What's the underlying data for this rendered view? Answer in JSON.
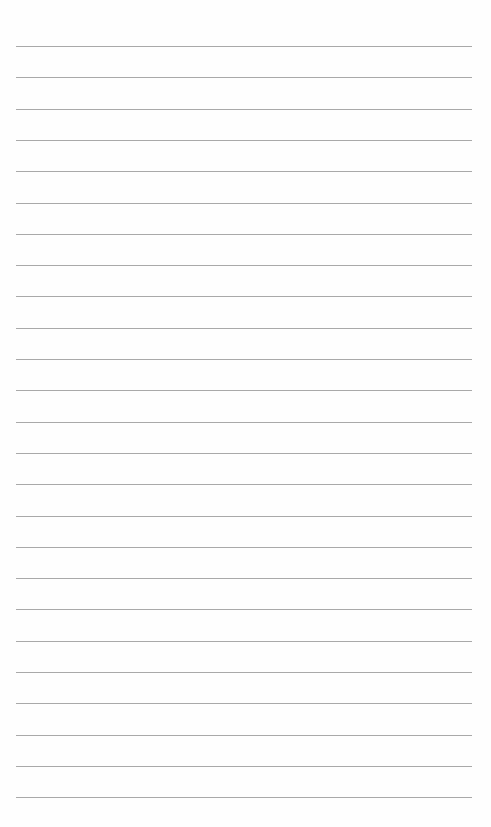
{
  "page": {
    "type": "ruled-blank-page",
    "background": "#fefefe",
    "rule_color": "#a9a9a9",
    "rule_count": 25,
    "first_rule_y": 46,
    "rule_spacing": 31.3,
    "rule_left": 16,
    "rule_width": 456
  }
}
